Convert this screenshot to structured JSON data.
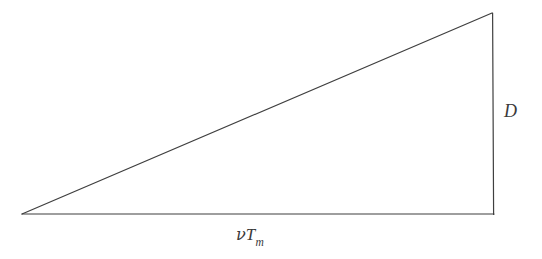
{
  "figure": {
    "type": "right-triangle-diagram",
    "canvas": {
      "width": 542,
      "height": 259,
      "background_color": "#ffffff"
    },
    "stroke": {
      "color": "#3f3f3f",
      "width": 1.2
    },
    "geometry": {
      "apex_left": {
        "x": 22,
        "y": 214
      },
      "corner_bottom_right": {
        "x": 494,
        "y": 214
      },
      "corner_top_right": {
        "x": 492,
        "y": 13
      },
      "base_length_px": 472,
      "height_length_px": 201
    },
    "labels": {
      "base": {
        "id": "base-label",
        "text_full": "νTₘ",
        "symbol": "ν",
        "variable": "T",
        "subscript": "m",
        "position": {
          "x": 254,
          "y": 238
        },
        "color": "#3a3a3a"
      },
      "height": {
        "id": "height-label",
        "text_full": "D",
        "variable": "D",
        "position": {
          "x": 512,
          "y": 115
        },
        "color": "#3a3a3a"
      }
    },
    "edges": [
      {
        "name": "base-edge",
        "from": "apex_left",
        "to": "corner_bottom_right"
      },
      {
        "name": "vertical-edge",
        "from": "corner_top_right",
        "to": "corner_bottom_right"
      },
      {
        "name": "hypotenuse-edge",
        "from": "apex_left",
        "to": "corner_top_right"
      }
    ]
  }
}
